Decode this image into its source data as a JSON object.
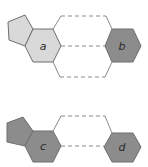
{
  "diagram": {
    "colors": {
      "light_fill": "#d9d9d9",
      "dark_fill": "#8c8c8c",
      "stroke": "#6e6e6e",
      "connector": "#8a8a8a",
      "label": "#2b2b2b"
    },
    "groups": [
      {
        "id": "top",
        "nodes": [
          {
            "id": "pentagon-top",
            "shape": "pentagon",
            "fill": "light",
            "label": ""
          },
          {
            "id": "a",
            "shape": "hexagon",
            "fill": "light",
            "label": "a"
          },
          {
            "id": "b",
            "shape": "hexagon",
            "fill": "dark",
            "label": "b"
          }
        ],
        "connections": 3,
        "connector_style": "dashed"
      },
      {
        "id": "bottom",
        "nodes": [
          {
            "id": "pentagon-bottom",
            "shape": "pentagon",
            "fill": "dark",
            "label": ""
          },
          {
            "id": "c",
            "shape": "hexagon",
            "fill": "dark",
            "label": "c"
          },
          {
            "id": "d",
            "shape": "hexagon",
            "fill": "dark",
            "label": "d"
          }
        ],
        "connections": 2,
        "connector_style": "dashed"
      }
    ],
    "labels": {
      "a": "a",
      "b": "b",
      "c": "c",
      "d": "d"
    }
  }
}
